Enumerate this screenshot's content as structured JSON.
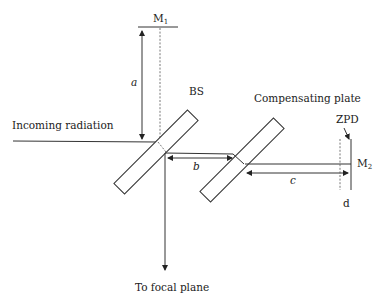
{
  "diagram": {
    "labels": {
      "m1": "M",
      "m1_sub": "1",
      "m2": "M",
      "m2_sub": "2",
      "a": "a",
      "b": "b",
      "c": "c",
      "d": "d",
      "bs": "BS",
      "compensating_plate": "Compensating plate",
      "zpd": "ZPD",
      "incoming": "Incoming radiation",
      "focal": "To focal plane"
    },
    "colors": {
      "line": "#333333",
      "text": "#222222",
      "background": "#ffffff"
    }
  }
}
